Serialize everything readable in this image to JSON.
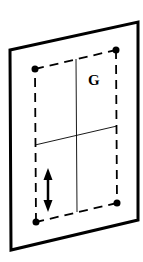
{
  "diagram": {
    "title": "",
    "labels": {
      "g_label": "G"
    },
    "colors": {
      "stroke": "#000000",
      "background": "#ffffff"
    },
    "elements": [
      {
        "name": "outer-panel",
        "shape": "parallelogram",
        "style": "thick solid"
      },
      {
        "name": "inner-rectangle",
        "shape": "dashed quadrilateral",
        "style": "dashed",
        "corner_markers": 4
      },
      {
        "name": "vertical-centerline",
        "style": "thin solid"
      },
      {
        "name": "horizontal-centerline",
        "style": "thin solid"
      },
      {
        "name": "vertical-double-arrow",
        "style": "bold arrow",
        "direction": "up-down"
      },
      {
        "name": "g-label",
        "text": "G"
      }
    ]
  }
}
